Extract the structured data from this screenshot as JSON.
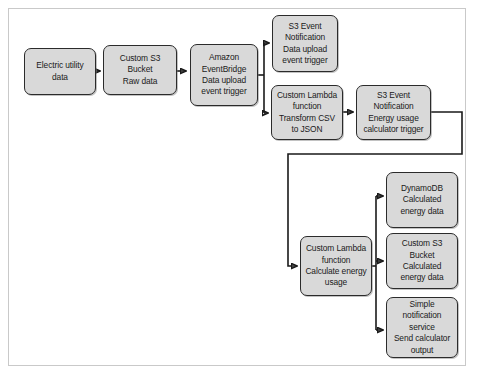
{
  "diagram": {
    "style": {
      "node_fill": "#d9d9d9",
      "node_border": "#2b2b2b",
      "frame_border": "#c9c9c9",
      "canvas_background": "#ffffff",
      "connector_color": "#1a1a1a"
    },
    "nodes": [
      {
        "id": "electric-utility-data",
        "label": "Electric utility\ndata",
        "x": 24,
        "y": 48,
        "w": 72,
        "h": 47
      },
      {
        "id": "custom-s3-bucket-raw-data",
        "label": "Custom S3\nBucket\nRaw data",
        "x": 103,
        "y": 45,
        "w": 74,
        "h": 50
      },
      {
        "id": "amazon-eventbridge",
        "label": "Amazon\nEventBridge\nData upload\nevent trigger",
        "x": 190,
        "y": 44,
        "w": 68,
        "h": 62
      },
      {
        "id": "s3-event-notification-data-upload",
        "label": "S3 Event\nNotification\nData upload\nevent trigger",
        "x": 272,
        "y": 15,
        "w": 66,
        "h": 57
      },
      {
        "id": "custom-lambda-transform-csv",
        "label": "Custom Lambda\nfunction\nTransform CSV\nto JSON",
        "x": 271,
        "y": 85,
        "w": 72,
        "h": 55
      },
      {
        "id": "s3-event-notification-energy-calculator",
        "label": "S3 Event\nNotification\nEnergy usage\ncalculator trigger",
        "x": 356,
        "y": 85,
        "w": 75,
        "h": 55
      },
      {
        "id": "custom-lambda-calculate-energy",
        "label": "Custom Lambda\nfunction\nCalculate energy\nusage",
        "x": 300,
        "y": 236,
        "w": 72,
        "h": 60
      },
      {
        "id": "dynamodb-calculated-energy-data",
        "label": "DynamoDB\nCalculated\nenergy data",
        "x": 386,
        "y": 172,
        "w": 72,
        "h": 56
      },
      {
        "id": "custom-s3-bucket-calculated-energy-data",
        "label": "Custom S3 Bucket\nCalculated\nenergy data",
        "x": 386,
        "y": 233,
        "w": 72,
        "h": 56
      },
      {
        "id": "simple-notification-service",
        "label": "Simple\nnotification\nservice\nSend calculator\noutput",
        "x": 386,
        "y": 297,
        "w": 72,
        "h": 61
      }
    ],
    "connectors": [
      {
        "id": "utility-to-s3raw",
        "from": "electric-utility-data",
        "to": "custom-s3-bucket-raw-data",
        "path": "M 96 71 L 99 71"
      },
      {
        "id": "s3raw-to-eventbridge",
        "from": "custom-s3-bucket-raw-data",
        "to": "amazon-eventbridge",
        "path": "M 177 71 L 186 71"
      },
      {
        "id": "eventbridge-fanout-trunk",
        "from": "amazon-eventbridge",
        "to": "fan-out",
        "path": "M 258 75 L 264 75 M 264 44 L 264 112"
      },
      {
        "id": "fanout-to-s3-event-upload",
        "from": "fan-out",
        "to": "s3-event-notification-data-upload",
        "path": "M 264 44 L 268 44"
      },
      {
        "id": "fanout-to-lambda-transform",
        "from": "fan-out",
        "to": "custom-lambda-transform-csv",
        "path": "M 264 112 L 267 112"
      },
      {
        "id": "transform-to-s3-event-calculator",
        "from": "custom-lambda-transform-csv",
        "to": "s3-event-notification-energy-calculator",
        "path": "M 343 112 L 352 112"
      },
      {
        "id": "calculator-trigger-to-calculate-lambda",
        "from": "s3-event-notification-energy-calculator",
        "to": "custom-lambda-calculate-energy",
        "path": "M 431 112 L 462 112 L 462 154 L 288 154 L 288 266 L 296 266"
      },
      {
        "id": "calculate-fanout-trunk",
        "from": "custom-lambda-calculate-energy",
        "to": "output-fan-out",
        "path": "M 372 266 L 376 266 M 376 196 L 376 330"
      },
      {
        "id": "fanout-to-dynamodb",
        "from": "output-fan-out",
        "to": "dynamodb-calculated-energy-data",
        "path": "M 376 196 L 382 196"
      },
      {
        "id": "fanout-to-s3-calculated",
        "from": "output-fan-out",
        "to": "custom-s3-bucket-calculated-energy-data",
        "path": "M 376 261 L 382 261"
      },
      {
        "id": "fanout-to-sns",
        "from": "output-fan-out",
        "to": "simple-notification-service",
        "path": "M 376 330 L 382 330"
      }
    ]
  }
}
